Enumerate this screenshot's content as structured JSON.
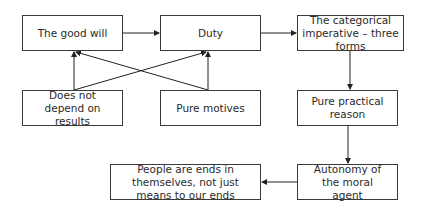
{
  "nodes": {
    "good_will": "The good will",
    "duty": "Duty",
    "categorical": "The categorical imperative – three forms",
    "not_depend": "Does not depend on results",
    "pure_motives": "Pure motives",
    "pure_reason": "Pure practical reason",
    "autonomy": "Autonomy of the moral agent",
    "ends": "People are ends in themselves, not just means to our ends"
  },
  "edges": [
    {
      "from": "good_will",
      "to": "duty"
    },
    {
      "from": "duty",
      "to": "categorical"
    },
    {
      "from": "categorical",
      "to": "pure_reason"
    },
    {
      "from": "pure_reason",
      "to": "autonomy"
    },
    {
      "from": "autonomy",
      "to": "ends"
    },
    {
      "from": "not_depend",
      "to": "good_will"
    },
    {
      "from": "not_depend",
      "to": "duty"
    },
    {
      "from": "pure_motives",
      "to": "good_will"
    },
    {
      "from": "pure_motives",
      "to": "duty"
    }
  ]
}
